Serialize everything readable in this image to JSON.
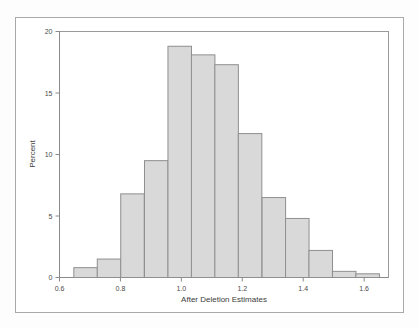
{
  "figure": {
    "kind": "histogram-figure",
    "background_color": "#ffffff",
    "frame_color": "#a9a9a9"
  },
  "chart_data": {
    "type": "bar",
    "subtype": "histogram",
    "title": "",
    "xlabel": "After Deletion Estimates",
    "ylabel": "Percent",
    "xlim": [
      0.6,
      1.68
    ],
    "ylim": [
      0,
      20
    ],
    "grid": false,
    "legend": null,
    "bar_fill_color": "#d9d9d9",
    "bar_edge_color": "#8f8f8f",
    "bin_width": 0.0772,
    "xticks": [
      0.6,
      0.8,
      1.0,
      1.2,
      1.4,
      1.6
    ],
    "xtick_labels": [
      "0.6",
      "0.8",
      "1.0",
      "1.2",
      "1.4",
      "1.6"
    ],
    "yticks": [
      0,
      5,
      10,
      15,
      20
    ],
    "ytick_labels": [
      "0",
      "5",
      "10",
      "15",
      "20"
    ],
    "bin_left_edges": [
      0.647,
      0.724,
      0.801,
      0.879,
      0.956,
      1.033,
      1.11,
      1.187,
      1.265,
      1.342,
      1.419,
      1.496,
      1.573
    ],
    "bin_centers": [
      0.686,
      0.763,
      0.84,
      0.917,
      0.994,
      1.072,
      1.149,
      1.226,
      1.303,
      1.38,
      1.458,
      1.535,
      1.612
    ],
    "categories": [
      "0.686",
      "0.763",
      "0.840",
      "0.917",
      "0.994",
      "1.072",
      "1.149",
      "1.226",
      "1.303",
      "1.380",
      "1.458",
      "1.535",
      "1.612"
    ],
    "values": [
      0.8,
      1.5,
      6.8,
      9.5,
      18.8,
      18.1,
      17.3,
      11.7,
      6.5,
      4.8,
      2.2,
      0.5,
      0.3
    ]
  }
}
